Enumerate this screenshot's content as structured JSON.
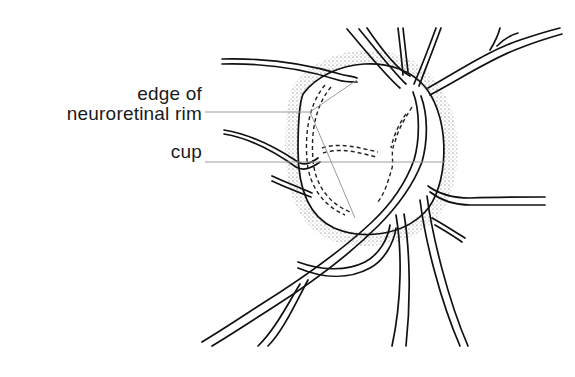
{
  "figure": {
    "type": "anatomical line drawing",
    "labels": [
      {
        "id": "edge",
        "lines": [
          "edge of",
          "neuroretinal rim"
        ]
      },
      {
        "id": "cup",
        "lines": [
          "cup"
        ]
      }
    ],
    "colors": {
      "ink": "#111111",
      "leader_lines": "#9a9a9a",
      "background": "#ffffff"
    }
  }
}
